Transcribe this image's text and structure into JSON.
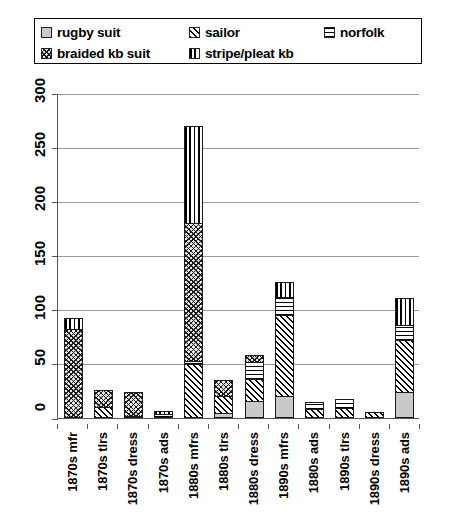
{
  "legend": {
    "rows": [
      [
        {
          "label": "rugby suit",
          "pattern": "p-rugby",
          "icon": "legend-swatch-rugby-suit"
        },
        {
          "label": "sailor",
          "pattern": "p-sailor",
          "icon": "legend-swatch-sailor"
        },
        {
          "label": "norfolk",
          "pattern": "p-norfolk",
          "icon": "legend-swatch-norfolk"
        }
      ],
      [
        {
          "label": "braided kb suit",
          "pattern": "p-braided",
          "icon": "legend-swatch-braided-kb-suit"
        },
        {
          "label": "stripe/pleat kb",
          "pattern": "p-stripe",
          "icon": "legend-swatch-stripe-pleat-kb"
        }
      ]
    ]
  },
  "axis": {
    "y_ticks": [
      "300",
      "250",
      "200",
      "150",
      "100",
      "50",
      "0"
    ]
  },
  "chart_data": {
    "type": "bar",
    "title": "",
    "xlabel": "",
    "ylabel": "",
    "ylim": [
      0,
      300
    ],
    "ytick_step": 50,
    "grid": true,
    "stacked": true,
    "legend_position": "top",
    "categories": [
      "1870s mfr",
      "1870s tlrs",
      "1870s dress",
      "1870s ads",
      "1880s mfrs",
      "1880s tlrs",
      "1880s dress",
      "1890s mfrs",
      "1880s ads",
      "1890s tlrs",
      "1890s dress",
      "1890s ads"
    ],
    "series": [
      {
        "name": "rugby suit",
        "pattern": "p-rugby",
        "values": [
          0,
          0,
          0,
          0,
          0,
          5,
          16,
          20,
          0,
          0,
          0,
          24
        ]
      },
      {
        "name": "sailor",
        "pattern": "p-sailor",
        "values": [
          0,
          10,
          2,
          0,
          50,
          15,
          20,
          75,
          8,
          9,
          6,
          48
        ]
      },
      {
        "name": "norfolk",
        "pattern": "p-norfolk",
        "values": [
          0,
          0,
          0,
          4,
          3,
          0,
          16,
          17,
          7,
          9,
          0,
          14
        ]
      },
      {
        "name": "braided kb suit",
        "pattern": "p-braided",
        "values": [
          82,
          16,
          22,
          0,
          127,
          15,
          6,
          0,
          0,
          0,
          0,
          0
        ]
      },
      {
        "name": "stripe/pleat kb",
        "pattern": "p-stripe",
        "values": [
          10,
          0,
          0,
          1,
          90,
          0,
          0,
          14,
          0,
          0,
          0,
          25
        ]
      }
    ],
    "totals": [
      92,
      26,
      24,
      5,
      270,
      35,
      58,
      126,
      15,
      18,
      6,
      111
    ]
  }
}
